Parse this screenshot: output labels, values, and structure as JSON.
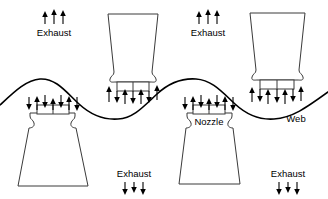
{
  "diagram": {
    "colors": {
      "background": "#ffffff",
      "line": "#000000",
      "nozzle_outline": "#3a3a3a",
      "nozzle_fill": "#ffffff"
    },
    "labels": {
      "exhaust": "Exhaust",
      "nozzle": "Nozzle",
      "web": "Web"
    },
    "annotations": [
      {
        "id": "exhaust-top-left",
        "text": "Exhaust",
        "x": 54,
        "y": 33,
        "arrows": "up",
        "arrow_count": 3,
        "arrow_y": 12,
        "arrow_len": 13
      },
      {
        "id": "exhaust-top-right",
        "text": "Exhaust",
        "x": 208,
        "y": 33,
        "arrows": "up",
        "arrow_count": 3,
        "arrow_y": 12,
        "arrow_len": 13
      },
      {
        "id": "exhaust-bottom-mid",
        "text": "Exhaust",
        "x": 134,
        "y": 177,
        "arrows": "down",
        "arrow_count": 3,
        "arrow_y": 182,
        "arrow_len": 13
      },
      {
        "id": "exhaust-bottom-right",
        "text": "Exhaust",
        "x": 288,
        "y": 177,
        "arrows": "down",
        "arrow_count": 3,
        "arrow_y": 182,
        "arrow_len": 13
      },
      {
        "id": "nozzle-label",
        "text": "Nozzle",
        "x": 209,
        "y": 124
      },
      {
        "id": "web-label",
        "text": "Web",
        "x": 296,
        "y": 121
      }
    ],
    "web": {
      "description": "sinusoidal web sheet spanning full width",
      "amplitude": 20,
      "midline_y": 98,
      "crest_x": [
        40,
        196
      ],
      "trough_x": [
        118,
        274
      ]
    },
    "nozzles": [
      {
        "id": "nozzle-top-mid",
        "orientation": "down",
        "center_x": 133,
        "label": "Nozzle"
      },
      {
        "id": "nozzle-top-right",
        "orientation": "down",
        "center_x": 277,
        "label": "Nozzle"
      },
      {
        "id": "nozzle-bottom-left",
        "orientation": "up",
        "center_x": 52,
        "label": "Nozzle"
      },
      {
        "id": "nozzle-bottom-mid",
        "orientation": "up",
        "center_x": 209,
        "label": "Nozzle"
      }
    ]
  }
}
